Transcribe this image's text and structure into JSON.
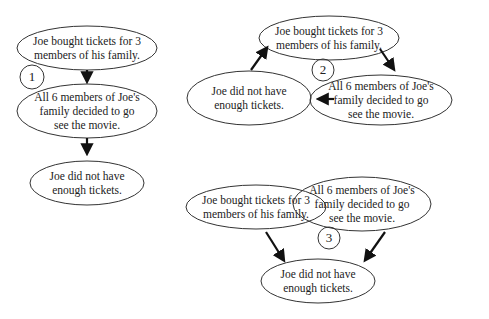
{
  "diagrams": [
    {
      "number": "1",
      "nodes": [
        {
          "text": "Joe bought tickets for 3\nmembers of his family.",
          "cx": 87,
          "cy": 48,
          "rx": 70,
          "ry": 22
        },
        {
          "text": "All 6 members of Joe's\nfamily decided to go\nsee the movie.",
          "cx": 87,
          "cy": 111,
          "rx": 70,
          "ry": 27
        },
        {
          "text": "Joe did not have\nenough tickets.",
          "cx": 87,
          "cy": 183,
          "rx": 57,
          "ry": 22
        }
      ]
    },
    {
      "number": "2",
      "nodes": [
        {
          "text": "Joe bought tickets for 3\nmembers of his family.",
          "cx": 329,
          "cy": 38,
          "rx": 70,
          "ry": 22
        },
        {
          "text": "All 6 members of Joe's\nfamily decided to go\nsee the movie.",
          "cx": 381,
          "cy": 100,
          "rx": 71,
          "ry": 25
        },
        {
          "text": "Joe did not have\nenough tickets.",
          "cx": 249,
          "cy": 98,
          "rx": 62,
          "ry": 27
        }
      ]
    },
    {
      "number": "3",
      "nodes": [
        {
          "text": "Joe bought tickets for 3\nmembers of his family.",
          "cx": 256,
          "cy": 207,
          "rx": 70,
          "ry": 22
        },
        {
          "text": "All 6 members of Joe's\nfamily decided to go\nsee the movie.",
          "cx": 362,
          "cy": 204,
          "rx": 69,
          "ry": 27
        },
        {
          "text": "Joe did not have\nenough tickets.",
          "cx": 318,
          "cy": 281,
          "rx": 57,
          "ry": 22
        }
      ]
    }
  ],
  "labels": {
    "d1_n1": "Joe bought tickets for 3\nmembers of his family.",
    "d1_n2": "All 6 members of Joe's\nfamily decided to go\nsee the movie.",
    "d1_n3": "Joe did not have\nenough tickets.",
    "d2_n1": "Joe bought tickets for 3\nmembers of his family.",
    "d2_n2": "All 6 members of Joe's\nfamily decided to go\nsee the movie.",
    "d2_n3": "Joe did not have\nenough tickets.",
    "d3_n1": "Joe bought tickets for 3\nmembers of his family.",
    "d3_n2": "All 6 members of Joe's\nfamily decided to go\nsee the movie.",
    "d3_n3": "Joe did not have\nenough tickets.",
    "num1": "1",
    "num2": "2",
    "num3": "3"
  }
}
